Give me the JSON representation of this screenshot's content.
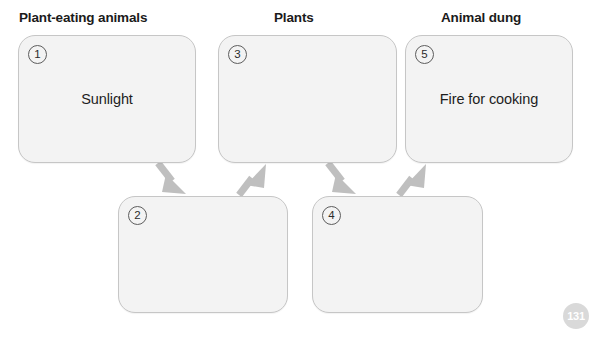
{
  "page": {
    "badge_number": "131",
    "clipped_caption": ""
  },
  "diagram": {
    "title": "",
    "columns": [
      {
        "label": "Plant-eating animals"
      },
      {
        "label": "Plants"
      },
      {
        "label": "Animal dung"
      }
    ],
    "boxes": [
      {
        "number": "1",
        "text": "Sunlight",
        "filled": true
      },
      {
        "number": "2",
        "text": "",
        "filled": false
      },
      {
        "number": "3",
        "text": "",
        "filled": false
      },
      {
        "number": "4",
        "text": "",
        "filled": false
      },
      {
        "number": "5",
        "text": "Fire for cooking",
        "filled": true
      }
    ],
    "arrows": [
      {
        "from": "1",
        "to": "2",
        "direction": "down-right"
      },
      {
        "from": "2",
        "to": "3",
        "direction": "up-right"
      },
      {
        "from": "3",
        "to": "4",
        "direction": "down-right"
      },
      {
        "from": "4",
        "to": "5",
        "direction": "up-right"
      }
    ]
  },
  "colors": {
    "box_fill": "#f3f3f3",
    "box_border": "#c6c6c6",
    "arrow": "#bfbfbf",
    "heading_text": "#1b1b1b",
    "badge_bg": "#d9d9d9"
  }
}
